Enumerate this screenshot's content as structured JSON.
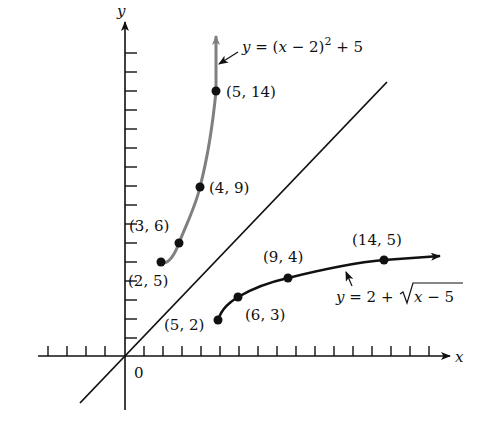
{
  "axes": {
    "x_label": "x",
    "y_label": "y",
    "origin_label": "0",
    "origin_px": [
      125,
      356
    ],
    "x_ticks_px": [
      48,
      67,
      86,
      105,
      144,
      163,
      182,
      201,
      220,
      239,
      258,
      277,
      296,
      315,
      334,
      353,
      372,
      391,
      410,
      429
    ],
    "y_ticks_px": [
      338,
      319,
      300,
      281,
      262,
      243,
      224,
      205,
      186,
      167,
      148,
      129,
      110,
      91,
      72,
      53
    ]
  },
  "curves": {
    "parabola": {
      "label_prefix": "y = (x − 2)",
      "label_exp": "2",
      "label_suffix": " + 5",
      "color": "#808080",
      "points": [
        {
          "label": "(2, 5)",
          "px": [
            161,
            262
          ]
        },
        {
          "label": "(3, 6)",
          "px": [
            179,
            243
          ]
        },
        {
          "label": "(4, 9)",
          "px": [
            200,
            187
          ]
        },
        {
          "label": "(5, 14)",
          "px": [
            216,
            91
          ]
        }
      ]
    },
    "sqrt": {
      "label_prefix": "y = 2 + ",
      "label_radicand": "x − 5",
      "color": "#111111",
      "points": [
        {
          "label": "(5, 2)",
          "px": [
            218,
            320
          ]
        },
        {
          "label": "(6, 3)",
          "px": [
            238,
            297
          ]
        },
        {
          "label": "(9, 4)",
          "px": [
            288,
            278
          ]
        },
        {
          "label": "(14, 5)",
          "px": [
            384,
            260
          ]
        }
      ]
    },
    "identity_line": {
      "from_px": [
        80,
        403
      ],
      "to_px": [
        387,
        82
      ],
      "color": "#111111"
    }
  }
}
